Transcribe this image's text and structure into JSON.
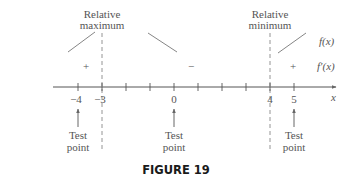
{
  "figure": {
    "caption": "FIGURE 19",
    "axis": {
      "variable": "x",
      "tick_labels": [
        {
          "value": -4,
          "label": "−4",
          "x": 78
        },
        {
          "value": -3,
          "label": "−3",
          "x": 102
        },
        {
          "value": 0,
          "label": "0",
          "x": 174
        },
        {
          "value": 4,
          "label": "4",
          "x": 270
        },
        {
          "value": 5,
          "label": "5",
          "x": 294
        }
      ],
      "tick_positions": [
        78,
        102,
        126,
        150,
        174,
        198,
        222,
        246,
        270,
        294
      ]
    },
    "critical_points": [
      {
        "x_value": -3,
        "label_line1": "Relative",
        "label_line2": "maximum"
      },
      {
        "x_value": 4,
        "label_line1": "Relative",
        "label_line2": "minimum"
      }
    ],
    "intervals": [
      {
        "sign": "+",
        "trend": "increasing"
      },
      {
        "sign": "−",
        "trend": "decreasing"
      },
      {
        "sign": "+",
        "trend": "increasing"
      }
    ],
    "row_labels": {
      "function": "f(x)",
      "derivative": "f′(x)"
    },
    "test_points": [
      {
        "x_value": -4,
        "line1": "Test",
        "line2": "point"
      },
      {
        "x_value": 0,
        "line1": "Test",
        "line2": "point"
      },
      {
        "x_value": 5,
        "line1": "Test",
        "line2": "point"
      }
    ],
    "colors": {
      "line": "#777777",
      "text": "#555555",
      "caption": "#1a1a1a"
    }
  }
}
